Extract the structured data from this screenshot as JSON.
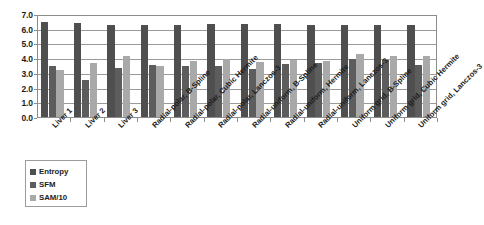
{
  "chart_data": {
    "type": "bar",
    "title": "",
    "xlabel": "",
    "ylabel": "",
    "ylim": [
      0.0,
      7.0
    ],
    "ytick_labels": [
      "0.0",
      "1.0",
      "2.0",
      "3.0",
      "4.0",
      "5.0",
      "6.0",
      "7.0"
    ],
    "ytick_values": [
      0.0,
      1.0,
      2.0,
      3.0,
      4.0,
      5.0,
      6.0,
      7.0
    ],
    "grid": true,
    "legend_position": "bottom-left",
    "categories": [
      "Liver 1",
      "Liver 2",
      "Liver 3",
      "Radial-polar, B-Spline",
      "Radial-polar, Cubic Hermite",
      "Radial-polar, Lanczos-3",
      "Radial-uniform, B-Spline",
      "Radial-uniform, Hermite",
      "Radial-uniform, Lanczos-3",
      "Uniform grid, B-Spline",
      "Uniform grid, Cubic Hermite",
      "Uniform grid, Lanczos-3"
    ],
    "series": [
      {
        "name": "Entropy",
        "color": "#4f4f4f",
        "values": [
          6.45,
          6.42,
          6.25,
          6.25,
          6.25,
          6.35,
          6.35,
          6.33,
          6.27,
          6.28,
          6.28,
          6.28
        ]
      },
      {
        "name": "SFM",
        "color": "#5d5d5d",
        "values": [
          3.48,
          2.52,
          3.3,
          3.52,
          3.48,
          3.5,
          3.28,
          3.57,
          3.66,
          3.95,
          3.88,
          3.52
        ]
      },
      {
        "name": "SAM/10",
        "color": "#a9a9a9",
        "values": [
          3.18,
          3.66,
          4.18,
          3.46,
          3.8,
          3.94,
          3.73,
          3.86,
          3.84,
          4.25,
          4.16,
          4.18
        ]
      }
    ]
  },
  "legend": {
    "items": [
      {
        "label": "Entropy",
        "swatch": "entropy"
      },
      {
        "label": "SFM",
        "swatch": "sfm"
      },
      {
        "label": "SAM/10",
        "swatch": "sam"
      }
    ]
  },
  "colors": {
    "entropy": "#4f4f4f",
    "sfm": "#5d5d5d",
    "sam": "#a9a9a9",
    "grid": "#9a9a9a",
    "axis": "#8c8c8c",
    "text": "#1c1c1c",
    "background": "#ffffff"
  }
}
